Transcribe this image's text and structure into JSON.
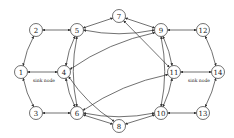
{
  "diagram": {
    "type": "network-graph",
    "nodes": [
      {
        "id": "1",
        "label": "1",
        "x": 21,
        "y": 72
      },
      {
        "id": "2",
        "label": "2",
        "x": 36,
        "y": 30
      },
      {
        "id": "3",
        "label": "3",
        "x": 36,
        "y": 113
      },
      {
        "id": "4",
        "label": "4",
        "x": 64,
        "y": 72
      },
      {
        "id": "5",
        "label": "5",
        "x": 77,
        "y": 30
      },
      {
        "id": "6",
        "label": "6",
        "x": 77,
        "y": 113
      },
      {
        "id": "7",
        "label": "7",
        "x": 119,
        "y": 16
      },
      {
        "id": "8",
        "label": "8",
        "x": 119,
        "y": 126
      },
      {
        "id": "9",
        "label": "9",
        "x": 161,
        "y": 30
      },
      {
        "id": "10",
        "label": "10",
        "x": 161,
        "y": 113
      },
      {
        "id": "11",
        "label": "11",
        "x": 174,
        "y": 72
      },
      {
        "id": "12",
        "label": "12",
        "x": 203,
        "y": 30
      },
      {
        "id": "13",
        "label": "13",
        "x": 203,
        "y": 113
      },
      {
        "id": "14",
        "label": "14",
        "x": 218,
        "y": 72
      }
    ],
    "annotations": [
      {
        "text": "sink node",
        "x": 33,
        "y": 82
      },
      {
        "text": "sink node",
        "x": 188,
        "y": 82
      }
    ],
    "edges": [
      [
        "1",
        "2"
      ],
      [
        "1",
        "3"
      ],
      [
        "1",
        "4"
      ],
      [
        "2",
        "5"
      ],
      [
        "3",
        "6"
      ],
      [
        "4",
        "5"
      ],
      [
        "4",
        "6"
      ],
      [
        "5",
        "6"
      ],
      [
        "5",
        "7"
      ],
      [
        "5",
        "9"
      ],
      [
        "4",
        "9"
      ],
      [
        "4",
        "8"
      ],
      [
        "6",
        "8"
      ],
      [
        "6",
        "10"
      ],
      [
        "6",
        "11"
      ],
      [
        "7",
        "9"
      ],
      [
        "7",
        "11"
      ],
      [
        "8",
        "10"
      ],
      [
        "9",
        "10"
      ],
      [
        "9",
        "11"
      ],
      [
        "10",
        "11"
      ],
      [
        "9",
        "12"
      ],
      [
        "10",
        "13"
      ],
      [
        "11",
        "14"
      ],
      [
        "12",
        "14"
      ],
      [
        "13",
        "14"
      ]
    ]
  }
}
